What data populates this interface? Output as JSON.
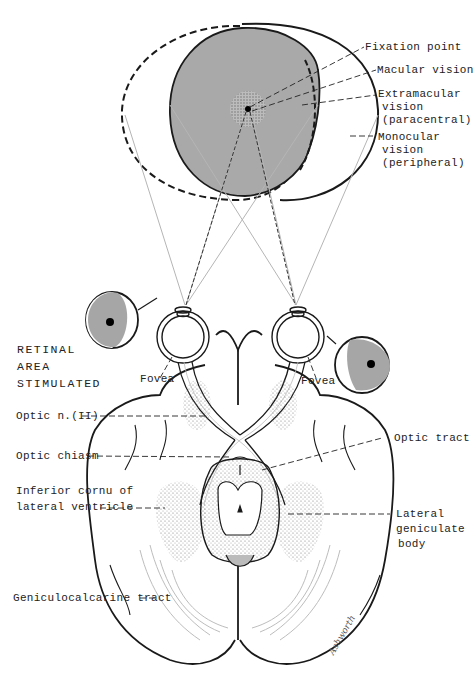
{
  "figure": {
    "colors": {
      "field_fill": "#a9a9a9",
      "retina_fill": "#a6a6a6",
      "line": "#1a1a1a",
      "ray": "#b5b5b5",
      "background": "#ffffff"
    }
  },
  "labels": {
    "fixation_point": "Fixation point",
    "macular_vision": "Macular vision",
    "extramacular_1": "Extramacular",
    "extramacular_2": "vision",
    "extramacular_3": "(paracentral)",
    "monocular_1": "Monocular",
    "monocular_2": "vision",
    "monocular_3": "(peripheral)",
    "retinal_1": "RETINAL",
    "retinal_2": "AREA",
    "retinal_3": "STIMULATED",
    "fovea_left": "Fovea",
    "fovea_right": "Fovea",
    "optic_nerve": "Optic n.(II)",
    "optic_chiasm": "Optic chiasm",
    "inferior_cornu_1": "Inferior cornu of",
    "inferior_cornu_2": "lateral ventricle",
    "optic_tract": "Optic tract",
    "lateral_geniculate_1": "Lateral",
    "lateral_geniculate_2": "geniculate",
    "lateral_geniculate_3": "body",
    "geniculocalcarine": "Geniculocalcarine tract",
    "signature": "Ashworth"
  }
}
